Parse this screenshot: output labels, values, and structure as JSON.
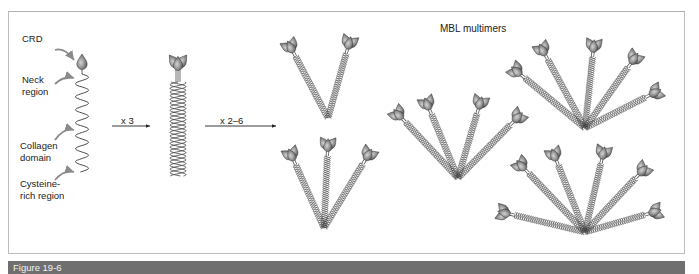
{
  "figure": {
    "caption": "Figure 19-6",
    "title": "MBL multimers",
    "colors": {
      "frame": "#bdbdbd",
      "caption_bar": "#6f6f6f",
      "caption_text": "#f2f2f2",
      "head_light": "#c9c9c9",
      "head_dark": "#555555",
      "coil": "#444444",
      "pointer": "#8a8a8a"
    }
  },
  "monomer_labels": [
    {
      "text": "CRD",
      "x": 22,
      "y": 42
    },
    {
      "text": "Neck",
      "x": 22,
      "y": 83
    },
    {
      "text": "region",
      "x": 22,
      "y": 95
    },
    {
      "text": "Collagen",
      "x": 20,
      "y": 149
    },
    {
      "text": "domain",
      "x": 20,
      "y": 161
    },
    {
      "text": "Cysteine-",
      "x": 20,
      "y": 187
    },
    {
      "text": "rich region",
      "x": 20,
      "y": 199
    }
  ],
  "arrows": [
    {
      "label": "x 3",
      "x1": 112,
      "x2": 150,
      "y": 126,
      "label_x": 121,
      "label_y": 115
    },
    {
      "label": "x 2–6",
      "x1": 205,
      "x2": 276,
      "y": 126,
      "label_x": 220,
      "label_y": 115
    }
  ],
  "monomer": {
    "head": [
      82,
      62
    ],
    "coil_top": 74,
    "coil_bottom": 172
  },
  "trimer": {
    "head": [
      178,
      60
    ],
    "coil_top": 82,
    "coil_bottom": 176
  },
  "multimers": [
    {
      "name": "dimer",
      "base": [
        328,
        118
      ],
      "heads": [
        [
          289,
          44
        ],
        [
          350,
          40
        ]
      ]
    },
    {
      "name": "trimer-bouquet",
      "base": [
        324,
        228
      ],
      "heads": [
        [
          290,
          152
        ],
        [
          328,
          142
        ],
        [
          370,
          152
        ]
      ]
    },
    {
      "name": "tetramer",
      "base": [
        458,
        178
      ],
      "heads": [
        [
          396,
          112
        ],
        [
          426,
          101
        ],
        [
          481,
          100
        ],
        [
          520,
          115
        ]
      ]
    },
    {
      "name": "hexamer-upper",
      "base": [
        585,
        128
      ],
      "heads": [
        [
          514,
          69
        ],
        [
          541,
          47
        ],
        [
          594,
          43
        ],
        [
          636,
          56
        ],
        [
          658,
          91
        ]
      ]
    },
    {
      "name": "hexamer-lower",
      "base": [
        585,
        232
      ],
      "heads": [
        [
          501,
          212
        ],
        [
          519,
          163
        ],
        [
          553,
          152
        ],
        [
          604,
          150
        ],
        [
          645,
          168
        ],
        [
          658,
          211
        ]
      ]
    }
  ],
  "pointers": [
    {
      "from": [
        55,
        50
      ],
      "to": [
        74,
        60
      ]
    },
    {
      "from": [
        55,
        84
      ],
      "to": [
        74,
        78
      ]
    },
    {
      "from": [
        55,
        140
      ],
      "to": [
        74,
        130
      ]
    },
    {
      "from": [
        55,
        180
      ],
      "to": [
        74,
        172
      ]
    }
  ]
}
